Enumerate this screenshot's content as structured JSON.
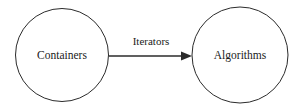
{
  "diagram": {
    "type": "node-edge-diagram",
    "background_color": "#ffffff",
    "stroke_color": "#2b2b2b",
    "text_color": "#1a1a1a",
    "nodes": [
      {
        "id": "containers",
        "label": "Containers",
        "shape": "circle",
        "center_x": 62,
        "center_y": 55,
        "radius": 46.5
      },
      {
        "id": "algorithms",
        "label": "Algorithms",
        "shape": "circle",
        "center_x": 240,
        "center_y": 55,
        "radius": 48
      }
    ],
    "edges": [
      {
        "id": "containers-to-algorithms",
        "label": "Iterators",
        "from": "containers",
        "to": "algorithms",
        "arrow": "single-head-right",
        "start_x": 109,
        "end_x": 192,
        "y": 56,
        "label_x": 151,
        "label_y": 42
      }
    ]
  }
}
